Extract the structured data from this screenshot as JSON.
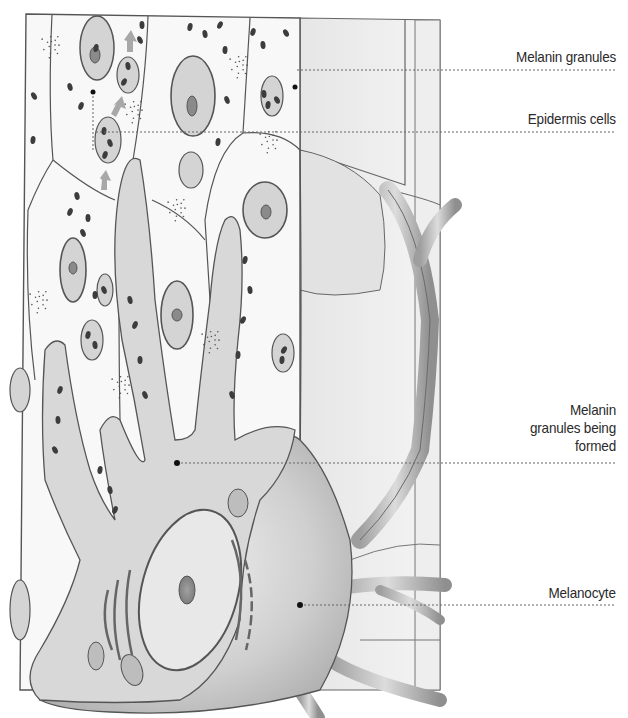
{
  "figure": {
    "labels": [
      {
        "id": "melanin-granules",
        "text": "Melanin granules"
      },
      {
        "id": "epidermis-cells",
        "text": "Epidermis cells"
      },
      {
        "id": "melanin-granules-being-formed",
        "lines": [
          "Melanin",
          "granules being",
          "formed"
        ]
      },
      {
        "id": "melanocyte",
        "text": "Melanocyte"
      }
    ],
    "colors": {
      "outline": "#555555",
      "cell_fill": "#f7f7f7",
      "melanocyte_fill": "#d9d9d9",
      "nucleus_fill": "#8a8a8a",
      "granule_fill": "#3c3c3c",
      "arrow": "#a8a8a8",
      "leader": "#666666",
      "label_text": "#2a2a2a"
    }
  }
}
